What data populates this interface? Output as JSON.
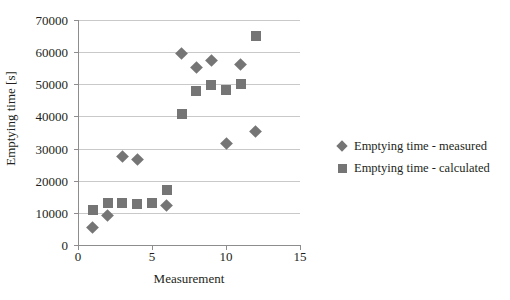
{
  "chart_data": {
    "type": "scatter",
    "title": "",
    "xlabel": "Measurement",
    "ylabel": "Emptying time [s]",
    "xlim": [
      0,
      15
    ],
    "ylim": [
      0,
      70000
    ],
    "xticks": [
      0,
      5,
      10,
      15
    ],
    "yticks": [
      0,
      10000,
      20000,
      30000,
      40000,
      50000,
      60000,
      70000
    ],
    "grid": true,
    "legend_position": "right",
    "marker_color": "#757575",
    "series": [
      {
        "name": "Emptying time - measured",
        "marker": "diamond",
        "color": "#757575",
        "points": [
          {
            "x": 1,
            "y": 5500
          },
          {
            "x": 2,
            "y": 9300
          },
          {
            "x": 3,
            "y": 27500
          },
          {
            "x": 4,
            "y": 26500
          },
          {
            "x": 6,
            "y": 12300
          },
          {
            "x": 7,
            "y": 59500
          },
          {
            "x": 8,
            "y": 55200
          },
          {
            "x": 9,
            "y": 57500
          },
          {
            "x": 10,
            "y": 31500
          },
          {
            "x": 11,
            "y": 56200
          },
          {
            "x": 12,
            "y": 35200
          }
        ]
      },
      {
        "name": "Emptying time - calculated",
        "marker": "square",
        "color": "#757575",
        "points": [
          {
            "x": 1,
            "y": 11000
          },
          {
            "x": 2,
            "y": 13000
          },
          {
            "x": 3,
            "y": 13200
          },
          {
            "x": 4,
            "y": 12800
          },
          {
            "x": 5,
            "y": 13200
          },
          {
            "x": 6,
            "y": 17000
          },
          {
            "x": 7,
            "y": 40800
          },
          {
            "x": 8,
            "y": 48000
          },
          {
            "x": 9,
            "y": 49700
          },
          {
            "x": 10,
            "y": 48300
          },
          {
            "x": 11,
            "y": 50000
          },
          {
            "x": 12,
            "y": 65000
          }
        ]
      }
    ]
  }
}
